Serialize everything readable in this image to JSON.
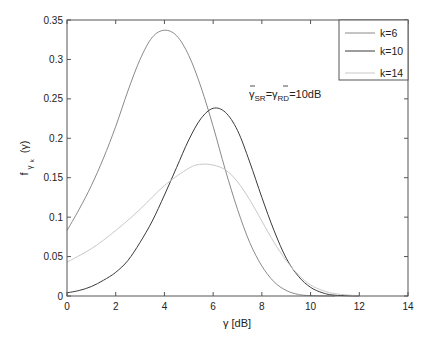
{
  "chart_data": {
    "type": "line",
    "title": "",
    "xlabel": "γ [dB]",
    "ylabel": "f_{γ_k}(γ)",
    "xlim": [
      0,
      14
    ],
    "ylim": [
      0,
      0.35
    ],
    "grid": false,
    "legend_position": "upper right",
    "xticks": [
      "0",
      "2",
      "4",
      "6",
      "8",
      "10",
      "12",
      "14"
    ],
    "yticks": [
      "0",
      "0.05",
      "0.1",
      "0.15",
      "0.2",
      "0.25",
      "0.3",
      "0.35"
    ],
    "annotation": "γ̄SR=γ̄RD=10dB",
    "series": [
      {
        "name": "k=6",
        "color": "#8a8a8a",
        "x": [
          0,
          0.5,
          1,
          1.5,
          2,
          2.5,
          3,
          3.5,
          4,
          4.5,
          5,
          5.5,
          6,
          6.5,
          7,
          7.5,
          8,
          8.5,
          9,
          9.5,
          10,
          11
        ],
        "y": [
          0.083,
          0.11,
          0.14,
          0.175,
          0.215,
          0.26,
          0.3,
          0.328,
          0.337,
          0.33,
          0.305,
          0.265,
          0.215,
          0.16,
          0.11,
          0.068,
          0.038,
          0.018,
          0.007,
          0.002,
          0.0005,
          0
        ]
      },
      {
        "name": "k=10",
        "color": "#3a3a3a",
        "x": [
          0,
          0.5,
          1,
          1.5,
          2,
          2.5,
          3,
          3.5,
          4,
          4.5,
          5,
          5.5,
          6,
          6.5,
          7,
          7.5,
          8,
          8.5,
          9,
          9.5,
          10,
          10.5,
          11,
          12
        ],
        "y": [
          0.004,
          0.007,
          0.012,
          0.02,
          0.03,
          0.045,
          0.068,
          0.095,
          0.128,
          0.163,
          0.198,
          0.225,
          0.238,
          0.233,
          0.21,
          0.17,
          0.125,
          0.083,
          0.048,
          0.025,
          0.011,
          0.004,
          0.001,
          0
        ]
      },
      {
        "name": "k=14",
        "color": "#c8c8c8",
        "x": [
          0,
          1,
          2,
          3,
          4,
          5,
          5.5,
          6,
          6.5,
          7,
          7.5,
          8,
          8.5,
          9,
          9.5,
          10,
          10.5,
          11,
          12
        ],
        "y": [
          0.043,
          0.06,
          0.083,
          0.11,
          0.14,
          0.162,
          0.167,
          0.166,
          0.16,
          0.145,
          0.122,
          0.095,
          0.068,
          0.045,
          0.027,
          0.014,
          0.007,
          0.003,
          0
        ]
      }
    ]
  },
  "plot": {
    "xlabel_main": "γ [dB]",
    "ylabel_f": "f",
    "ylabel_sub": "γ",
    "ylabel_subsub": "k",
    "ylabel_arg": "(γ)",
    "annotation_gamma1": "γ",
    "annotation_sub1": "SR",
    "annotation_eq": "=",
    "annotation_gamma2": "γ",
    "annotation_sub2": "RD",
    "annotation_value": "=10dB"
  }
}
